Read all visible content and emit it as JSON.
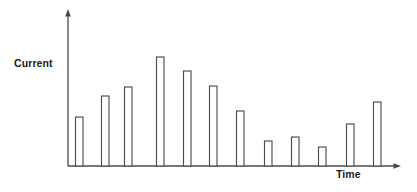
{
  "chart_data": {
    "type": "bar",
    "title": "",
    "subtitle": "",
    "xlabel": "Time",
    "ylabel": "Current",
    "grid": false,
    "legend": null,
    "axis_style": "arrow-ended open axes, no tick marks, no tick labels",
    "axis_color": "#4a4a4a",
    "bar_fill": "#ffffff",
    "bar_stroke": "#4d4d4d",
    "background": "#ffffff",
    "xlim": [
      0,
      12.8
    ],
    "ylim": [
      0,
      1.15
    ],
    "categories": [
      "1",
      "2",
      "3",
      "4",
      "5",
      "6",
      "7",
      "8",
      "9",
      "10",
      "11",
      "12"
    ],
    "values": [
      0.45,
      0.64,
      0.72,
      1.0,
      0.87,
      0.73,
      0.5,
      0.23,
      0.27,
      0.17,
      0.39,
      0.59
    ],
    "annotations": []
  },
  "axes": {
    "y": {
      "label": "Current",
      "origin_px": {
        "x": 68,
        "y": 166
      },
      "top_px": 10,
      "arrow": "up"
    },
    "x": {
      "label": "Time",
      "origin_px": {
        "x": 68,
        "y": 166
      },
      "end_px": 400,
      "arrow": "right"
    }
  },
  "bars": [
    {
      "index": 1,
      "x_px": 75.5,
      "top_px": 117,
      "width_px": 7.5,
      "height_px": 49
    },
    {
      "index": 2,
      "x_px": 101.5,
      "top_px": 96,
      "width_px": 7.5,
      "height_px": 70
    },
    {
      "index": 3,
      "x_px": 124.5,
      "top_px": 87,
      "width_px": 7.5,
      "height_px": 79
    },
    {
      "index": 4,
      "x_px": 156.5,
      "top_px": 57,
      "width_px": 7.5,
      "height_px": 109
    },
    {
      "index": 5,
      "x_px": 183.5,
      "top_px": 71,
      "width_px": 7.5,
      "height_px": 95
    },
    {
      "index": 6,
      "x_px": 209.5,
      "top_px": 86,
      "width_px": 7.5,
      "height_px": 80
    },
    {
      "index": 7,
      "x_px": 236.5,
      "top_px": 111,
      "width_px": 7.5,
      "height_px": 55
    },
    {
      "index": 8,
      "x_px": 264.5,
      "top_px": 141,
      "width_px": 7.5,
      "height_px": 25
    },
    {
      "index": 9,
      "x_px": 291.5,
      "top_px": 137,
      "width_px": 7.5,
      "height_px": 29
    },
    {
      "index": 10,
      "x_px": 318.5,
      "top_px": 147,
      "width_px": 7.5,
      "height_px": 19
    },
    {
      "index": 11,
      "x_px": 346.5,
      "top_px": 124,
      "width_px": 7.5,
      "height_px": 42
    },
    {
      "index": 12,
      "x_px": 373.5,
      "top_px": 102,
      "width_px": 7.5,
      "height_px": 64
    }
  ]
}
